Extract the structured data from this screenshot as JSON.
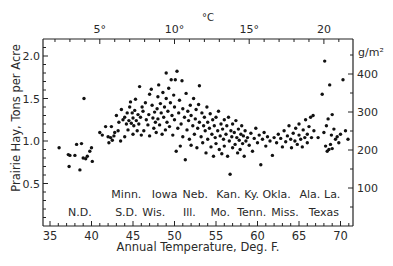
{
  "chart_data": {
    "type": "scatter",
    "title": "",
    "xlabel": "Annual Temperature, Deg. F.",
    "ylabel": "Prairie Hay, Tons per Acre",
    "xlim": [
      34,
      72
    ],
    "ylim": [
      0,
      2.2
    ],
    "x_ticks": [
      "35",
      "40",
      "45",
      "50",
      "55",
      "60",
      "65",
      "70"
    ],
    "y_ticks": [
      "0.5",
      "1.0",
      "1.5",
      "2.0"
    ],
    "secondary_x": {
      "label": "°C",
      "ticks": [
        {
          "value": 5,
          "label": "5°"
        },
        {
          "value": 10,
          "label": "10°"
        },
        {
          "value": 15,
          "label": "15°"
        },
        {
          "value": 20,
          "label": "20"
        }
      ]
    },
    "secondary_y": {
      "label": "g/m²",
      "ticks": [
        {
          "value": 100,
          "label": "100"
        },
        {
          "value": 200,
          "label": "200"
        },
        {
          "value": 300,
          "label": "300"
        },
        {
          "value": 400,
          "label": "400"
        }
      ]
    },
    "state_labels": {
      "row1": [
        {
          "x": 44.2,
          "text": "Minn."
        },
        {
          "x": 48.8,
          "text": "Iowa"
        },
        {
          "x": 52.5,
          "text": "Neb."
        },
        {
          "x": 56.5,
          "text": "Kan."
        },
        {
          "x": 59.3,
          "text": "Ky."
        },
        {
          "x": 62.3,
          "text": "Okla."
        },
        {
          "x": 66.3,
          "text": "Ala."
        },
        {
          "x": 69.0,
          "text": "La."
        }
      ],
      "row2": [
        {
          "x": 38.6,
          "text": "N.D."
        },
        {
          "x": 44.2,
          "text": "S.D."
        },
        {
          "x": 47.5,
          "text": "Wis."
        },
        {
          "x": 51.8,
          "text": "Ill."
        },
        {
          "x": 55.5,
          "text": "Mo."
        },
        {
          "x": 59.3,
          "text": "Tenn."
        },
        {
          "x": 63.3,
          "text": "Miss."
        },
        {
          "x": 68.0,
          "text": "Texas"
        }
      ]
    },
    "series": [
      {
        "name": "Prairie hay yield",
        "points": [
          [
            36.1,
            0.92
          ],
          [
            37.2,
            0.84
          ],
          [
            37.4,
            0.83
          ],
          [
            37.3,
            0.7
          ],
          [
            38.2,
            0.96
          ],
          [
            38.0,
            0.83
          ],
          [
            38.6,
            0.66
          ],
          [
            38.8,
            0.97
          ],
          [
            39.0,
            0.8
          ],
          [
            39.5,
            0.82
          ],
          [
            39.8,
            0.88
          ],
          [
            40.0,
            0.92
          ],
          [
            40.1,
            0.76
          ],
          [
            39.3,
            0.79
          ],
          [
            39.1,
            1.5
          ],
          [
            41.0,
            1.1
          ],
          [
            41.3,
            1.07
          ],
          [
            41.7,
            1.17
          ],
          [
            42.0,
            1.05
          ],
          [
            42.1,
            0.98
          ],
          [
            42.3,
            1.04
          ],
          [
            42.4,
            1.17
          ],
          [
            42.5,
            1.01
          ],
          [
            42.7,
            1.06
          ],
          [
            42.8,
            1.1
          ],
          [
            43.0,
            1.3
          ],
          [
            43.2,
            1.12
          ],
          [
            43.3,
            1.22
          ],
          [
            43.5,
            1.0
          ],
          [
            43.6,
            1.37
          ],
          [
            43.8,
            1.25
          ],
          [
            44.0,
            1.05
          ],
          [
            44.0,
            1.28
          ],
          [
            44.2,
            1.2
          ],
          [
            44.3,
            1.33
          ],
          [
            44.4,
            1.13
          ],
          [
            44.5,
            1.24
          ],
          [
            44.6,
            1.4
          ],
          [
            44.7,
            1.46
          ],
          [
            44.8,
            1.21
          ],
          [
            44.9,
            1.33
          ],
          [
            45.0,
            1.27
          ],
          [
            45.0,
            1.08
          ],
          [
            45.1,
            1.18
          ],
          [
            45.2,
            1.36
          ],
          [
            45.3,
            1.49
          ],
          [
            45.4,
            1.24
          ],
          [
            45.5,
            1.12
          ],
          [
            45.6,
            1.31
          ],
          [
            45.7,
            1.2
          ],
          [
            45.8,
            1.64
          ],
          [
            45.9,
            1.28
          ],
          [
            46.0,
            1.07
          ],
          [
            46.1,
            1.4
          ],
          [
            46.2,
            1.35
          ],
          [
            46.3,
            1.12
          ],
          [
            46.5,
            1.45
          ],
          [
            46.6,
            1.25
          ],
          [
            46.8,
            1.19
          ],
          [
            46.9,
            1.31
          ],
          [
            47.0,
            1.06
          ],
          [
            47.0,
            1.55
          ],
          [
            47.2,
            1.61
          ],
          [
            47.3,
            1.42
          ],
          [
            47.4,
            1.27
          ],
          [
            47.5,
            1.15
          ],
          [
            47.6,
            1.34
          ],
          [
            47.7,
            1.22
          ],
          [
            47.8,
            1.1
          ],
          [
            47.9,
            1.38
          ],
          [
            48.0,
            1.52
          ],
          [
            48.0,
            1.26
          ],
          [
            48.1,
            1.66
          ],
          [
            48.2,
            1.19
          ],
          [
            48.3,
            1.44
          ],
          [
            48.4,
            1.33
          ],
          [
            48.5,
            1.08
          ],
          [
            48.6,
            1.57
          ],
          [
            48.7,
            1.28
          ],
          [
            48.8,
            1.4
          ],
          [
            48.9,
            1.13
          ],
          [
            49.0,
            1.8
          ],
          [
            49.0,
            1.5
          ],
          [
            49.1,
            1.22
          ],
          [
            49.2,
            1.35
          ],
          [
            49.3,
            1.62
          ],
          [
            49.4,
            1.17
          ],
          [
            49.5,
            1.45
          ],
          [
            49.6,
            1.72
          ],
          [
            49.7,
            1.3
          ],
          [
            49.8,
            1.07
          ],
          [
            49.9,
            1.54
          ],
          [
            50.0,
            1.25
          ],
          [
            50.0,
            1.4
          ],
          [
            50.1,
            1.72
          ],
          [
            50.2,
            0.88
          ],
          [
            50.3,
            1.82
          ],
          [
            50.4,
            1.15
          ],
          [
            50.5,
            1.33
          ],
          [
            50.6,
            1.48
          ],
          [
            50.7,
            0.94
          ],
          [
            50.8,
            1.2
          ],
          [
            50.9,
            1.71
          ],
          [
            51.0,
            1.38
          ],
          [
            51.0,
            1.05
          ],
          [
            51.2,
            1.28
          ],
          [
            51.3,
            0.78
          ],
          [
            51.4,
            1.56
          ],
          [
            51.5,
            1.13
          ],
          [
            51.6,
            1.35
          ],
          [
            51.7,
            1.24
          ],
          [
            51.8,
            1.02
          ],
          [
            51.9,
            1.42
          ],
          [
            52.0,
            1.3
          ],
          [
            52.0,
            0.95
          ],
          [
            52.2,
            1.18
          ],
          [
            52.3,
            1.5
          ],
          [
            52.4,
            1.08
          ],
          [
            52.5,
            1.26
          ],
          [
            52.6,
            1.37
          ],
          [
            52.7,
            0.92
          ],
          [
            52.8,
            1.15
          ],
          [
            52.9,
            1.43
          ],
          [
            53.0,
            1.22
          ],
          [
            53.0,
            1.65
          ],
          [
            53.2,
            1.05
          ],
          [
            53.3,
            1.33
          ],
          [
            53.4,
            0.98
          ],
          [
            53.5,
            1.18
          ],
          [
            53.6,
            1.28
          ],
          [
            53.7,
            1.12
          ],
          [
            53.8,
            0.86
          ],
          [
            53.9,
            1.4
          ],
          [
            54.0,
            1.22
          ],
          [
            54.0,
            1.02
          ],
          [
            54.2,
            1.15
          ],
          [
            54.3,
            1.32
          ],
          [
            54.4,
            0.93
          ],
          [
            54.5,
            1.08
          ],
          [
            54.6,
            1.25
          ],
          [
            54.7,
            0.82
          ],
          [
            54.8,
            1.18
          ],
          [
            54.9,
            1.04
          ],
          [
            55.0,
            1.28
          ],
          [
            55.0,
            0.97
          ],
          [
            55.2,
            1.12
          ],
          [
            55.3,
            1.35
          ],
          [
            55.4,
            0.9
          ],
          [
            55.5,
            1.06
          ],
          [
            55.6,
            1.2
          ],
          [
            55.7,
            0.85
          ],
          [
            55.8,
            1.14
          ],
          [
            55.9,
            1.02
          ],
          [
            56.0,
            1.25
          ],
          [
            56.0,
            0.94
          ],
          [
            56.2,
            1.08
          ],
          [
            56.3,
            1.18
          ],
          [
            56.4,
            0.82
          ],
          [
            56.5,
            1.28
          ],
          [
            56.6,
            1.0
          ],
          [
            56.7,
            0.61
          ],
          [
            56.8,
            1.12
          ],
          [
            56.9,
            1.05
          ],
          [
            57.0,
            1.2
          ],
          [
            57.0,
            0.92
          ],
          [
            57.2,
            1.1
          ],
          [
            57.3,
            0.96
          ],
          [
            57.4,
            1.24
          ],
          [
            57.5,
            1.04
          ],
          [
            57.6,
            0.86
          ],
          [
            57.7,
            1.14
          ],
          [
            57.8,
            1.01
          ],
          [
            57.9,
            0.9
          ],
          [
            58.0,
            1.08
          ],
          [
            58.1,
            1.18
          ],
          [
            58.2,
            0.97
          ],
          [
            58.3,
            1.06
          ],
          [
            58.4,
            0.82
          ],
          [
            58.5,
            1.12
          ],
          [
            58.6,
            1.0
          ],
          [
            58.8,
            1.04
          ],
          [
            59.0,
            0.95
          ],
          [
            59.2,
            1.09
          ],
          [
            59.4,
            0.88
          ],
          [
            59.6,
            1.03
          ],
          [
            59.8,
            1.15
          ],
          [
            60.0,
            0.98
          ],
          [
            60.2,
            1.07
          ],
          [
            60.4,
            0.72
          ],
          [
            60.6,
            1.02
          ],
          [
            60.8,
            1.1
          ],
          [
            61.0,
            0.94
          ],
          [
            61.2,
            1.05
          ],
          [
            61.5,
            1.0
          ],
          [
            61.8,
            0.83
          ],
          [
            62.0,
            1.04
          ],
          [
            62.3,
            0.98
          ],
          [
            62.5,
            1.08
          ],
          [
            62.8,
            1.03
          ],
          [
            63.0,
            0.93
          ],
          [
            63.2,
            1.12
          ],
          [
            63.4,
            0.99
          ],
          [
            63.6,
            1.06
          ],
          [
            63.8,
            1.18
          ],
          [
            64.0,
            1.02
          ],
          [
            64.1,
            0.92
          ],
          [
            64.3,
            1.09
          ],
          [
            64.5,
            1.0
          ],
          [
            64.6,
            1.15
          ],
          [
            64.8,
            0.96
          ],
          [
            65.0,
            1.07
          ],
          [
            65.0,
            1.2
          ],
          [
            65.2,
            1.02
          ],
          [
            65.4,
            0.93
          ],
          [
            65.5,
            1.13
          ],
          [
            65.7,
            1.04
          ],
          [
            65.8,
            1.25
          ],
          [
            66.0,
            1.08
          ],
          [
            66.0,
            0.98
          ],
          [
            66.2,
            1.17
          ],
          [
            66.4,
            1.28
          ],
          [
            66.5,
            1.04
          ],
          [
            66.7,
            1.3
          ],
          [
            66.8,
            1.12
          ],
          [
            67.3,
            1.04
          ],
          [
            67.8,
            1.55
          ],
          [
            68.0,
            1.1
          ],
          [
            68.1,
            1.94
          ],
          [
            68.2,
            0.94
          ],
          [
            68.3,
            1.18
          ],
          [
            68.4,
            0.88
          ],
          [
            68.5,
            1.26
          ],
          [
            68.6,
            0.9
          ],
          [
            68.7,
            1.66
          ],
          [
            68.8,
            0.96
          ],
          [
            68.9,
            1.07
          ],
          [
            69.0,
            1.31
          ],
          [
            69.0,
            0.91
          ],
          [
            69.2,
            1.14
          ],
          [
            69.4,
            1.02
          ],
          [
            69.6,
            1.05
          ],
          [
            69.8,
            0.98
          ],
          [
            70.0,
            1.08
          ],
          [
            70.3,
            1.72
          ],
          [
            70.6,
            1.12
          ],
          [
            70.9,
            1.02
          ]
        ]
      }
    ]
  }
}
